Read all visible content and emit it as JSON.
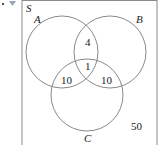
{
  "diagram": {
    "type": "venn",
    "universe_label": "S",
    "sets": [
      {
        "label": "A",
        "cx": 62,
        "cy": 52,
        "r": 36
      },
      {
        "label": "B",
        "cx": 110,
        "cy": 52,
        "r": 36
      },
      {
        "label": "C",
        "cx": 87,
        "cy": 95,
        "r": 36
      }
    ],
    "regions": {
      "A_and_B_only": "4",
      "A_and_B_and_C": "1",
      "A_and_C_only": "10",
      "B_and_C_only": "10",
      "outside": "50"
    },
    "colors": {
      "stroke": "#8a8a8a",
      "text": "#222222",
      "marker": "#9aa4b8"
    }
  }
}
